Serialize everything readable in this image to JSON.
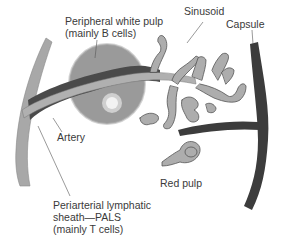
{
  "diagram": {
    "colors": {
      "background": "#ffffff",
      "trabecula_light": "#a8a8a8",
      "pals_dark": "#4a4a4a",
      "artery": "#b0b0b0",
      "white_pulp": "#9a9a9a",
      "germinal_center": "#e8e8e8",
      "sinusoid": "#adadad",
      "sinusoid_stroke": "#555555",
      "capsule": "#3c3c3c",
      "label_text": "#3a3a3a",
      "leader_line": "#555555"
    },
    "labels": {
      "peripheral_white_pulp_line1": "Peripheral white pulp",
      "peripheral_white_pulp_line2": "(mainly B cells)",
      "sinusoid": "Sinusoid",
      "capsule": "Capsule",
      "artery": "Artery",
      "red_pulp": "Red pulp",
      "pals_line1": "Periarterial lymphatic",
      "pals_line2": "sheath—PALS",
      "pals_line3": "(mainly T cells)"
    }
  }
}
